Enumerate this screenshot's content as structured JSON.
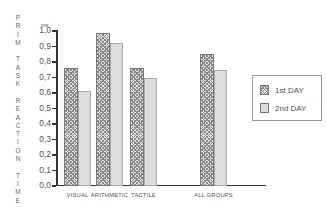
{
  "chart_data": {
    "type": "bar",
    "title": "",
    "xlabel": "",
    "ylabel": "PRIM TASK REACTION TIME",
    "yunit": "ms",
    "ylim": [
      0.0,
      1.0
    ],
    "yticks": [
      "0,0",
      "0,1",
      "0,2",
      "0,3",
      "0,4",
      "0,5",
      "0,6",
      "0,7",
      "0,8",
      "0,9",
      "1,0"
    ],
    "categories": [
      "VISUAL",
      "ARITHMETIC",
      "TACTILE",
      "ALL GROUPS"
    ],
    "series": [
      {
        "name": "1st DAY",
        "values": [
          0.76,
          0.99,
          0.76,
          0.85
        ]
      },
      {
        "name": "2nd DAY",
        "values": [
          0.61,
          0.92,
          0.7,
          0.75
        ]
      }
    ],
    "legend_position": "right",
    "grid": false
  },
  "labels": {
    "ylabel_letters": [
      "P",
      "R",
      "I",
      "M",
      "",
      "T",
      "A",
      "S",
      "K",
      "",
      "R",
      "E",
      "A",
      "C",
      "T",
      "I",
      "O",
      "N",
      "",
      "T",
      "I",
      "M",
      "E"
    ],
    "unit": "ms",
    "legend": [
      "1st DAY",
      "2nd DAY"
    ]
  }
}
